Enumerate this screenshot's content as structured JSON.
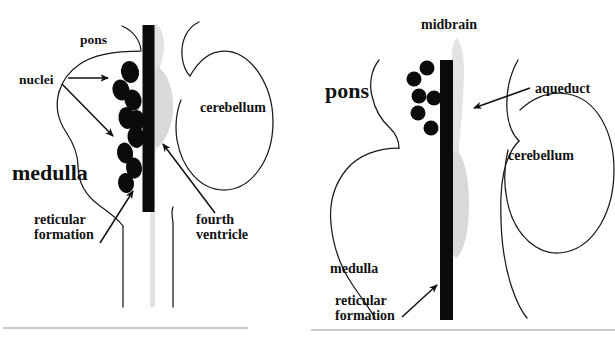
{
  "figure": {
    "background_color": "#ffffff",
    "ink_color": "#101010",
    "ventricle_color": "#d9d9d9",
    "rule_color": "#b8b8b8"
  },
  "panels": [
    {
      "id": "left-panel",
      "name": "medulla-pons-panel",
      "labels": {
        "pons": "pons",
        "nuclei": "nuclei",
        "medulla": "medulla",
        "reticular_formation_line1": "reticular",
        "reticular_formation_line2": "formation",
        "cerebellum": "cerebellum",
        "fourth_ventricle_line1": "fourth",
        "fourth_ventricle_line2": "ventricle"
      },
      "nuclei_count": 9,
      "structures": [
        "pons outline",
        "medulla outline",
        "reticular formation bar",
        "fourth ventricle",
        "cerebellum outline"
      ]
    },
    {
      "id": "right-panel",
      "name": "pons-midbrain-panel",
      "labels": {
        "midbrain": "midbrain",
        "pons": "pons",
        "aqueduct": "aqueduct",
        "cerebellum": "cerebellum",
        "medulla": "medulla",
        "reticular_formation_line1": "reticular",
        "reticular_formation_line2": "formation"
      },
      "nuclei_count": 6,
      "structures": [
        "midbrain aqueduct",
        "pons outline",
        "medulla outline",
        "reticular formation bar",
        "cerebellum outline"
      ]
    }
  ]
}
